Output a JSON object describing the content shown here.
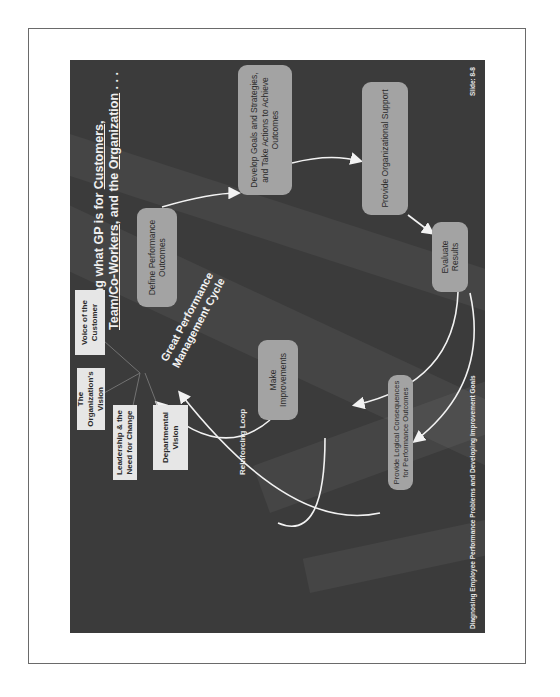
{
  "slide": {
    "title": {
      "prefix": "Defining what GP is for ",
      "customers": "Customers",
      "sep1": ", ",
      "team": "Team/Co-Workers",
      "sep2": ", and the ",
      "organization": "Organization",
      "suffix": " . . ."
    },
    "cycle_label": "Great Performance Management Cycle",
    "cycle_steps": [
      {
        "label": "Define Performance Outcomes"
      },
      {
        "label": "Develop Goals and Strategies, and Take Actions to Achieve Outcomes"
      },
      {
        "label": "Provide Organizational Support"
      },
      {
        "label": "Evaluate Results"
      },
      {
        "label": "Make Improvements"
      },
      {
        "label": "Provide Logical Consequences for Performance Outcomes"
      }
    ],
    "inputs": [
      {
        "label": "Voice of the Customer"
      },
      {
        "label": "The Organization's Vision"
      },
      {
        "label": "Leadership & the Need for Change"
      },
      {
        "label": "Departmental Vision"
      }
    ],
    "loop_label": "Reinforcing Loop",
    "footer": "Diagnosing Employee Performance Problems and Developing Improvement Goals",
    "slide_number": "Slide: 8-8",
    "colors": {
      "background": "#3b3b3b",
      "step_box": "#a3a3a3",
      "input_box": "#e6e6e6",
      "text_light": "#efefef",
      "arrow": "#f2f2f2"
    },
    "orientation": "rotated -90deg on page"
  }
}
